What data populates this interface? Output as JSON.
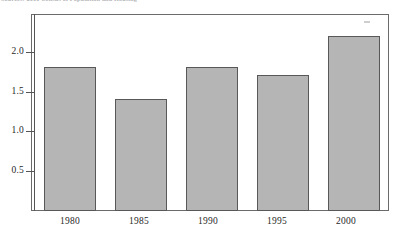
{
  "caption": {
    "text": "Sources: 2000 Census of Population and Housing"
  },
  "chart_data": {
    "type": "bar",
    "title": "",
    "subtitle": "",
    "xlabel": "",
    "ylabel": "",
    "categories": [
      "1980",
      "1985",
      "1990",
      "1995",
      "2000"
    ],
    "values": [
      1.8,
      1.4,
      1.8,
      1.7,
      2.2
    ],
    "series": [
      {
        "name": "",
        "values": [
          1.8,
          1.4,
          1.8,
          1.7,
          2.2
        ]
      }
    ],
    "ylim": [
      0,
      2.47
    ],
    "ytick_labels": [
      "0.5",
      "1.0",
      "1.5",
      "2.0"
    ],
    "ytick_values": [
      0.5,
      1.0,
      1.5,
      2.0
    ],
    "grid": false,
    "legend": null,
    "legend_position": "none",
    "bar_fill_color": "#b5b5b5",
    "bar_border_color": "#585858",
    "axis_color": "#555555",
    "frame_color": "#6b6b6b",
    "annotations": []
  },
  "artifacts": {
    "speck_label": "scan-speck"
  }
}
